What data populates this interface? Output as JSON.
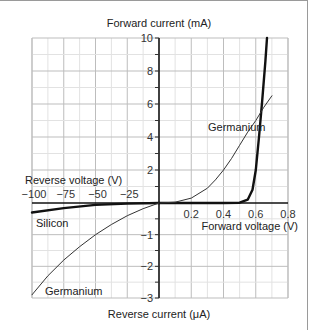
{
  "chart_data": {
    "type": "line",
    "title": "",
    "axes": {
      "y_top_label": "Forward current (mA)",
      "y_bottom_label": "Reverse current (μA)",
      "x_left_label": "Reverse voltage (V)",
      "x_right_label": "Forward voltage (V)",
      "x_left_ticks": [
        "−100",
        "−75",
        "−50",
        "−25"
      ],
      "x_left_tick_values": [
        -100,
        -75,
        -50,
        -25
      ],
      "x_right_ticks": [
        "0.2",
        "0.4",
        "0.6",
        "0.8"
      ],
      "x_right_tick_values": [
        0.2,
        0.4,
        0.6,
        0.8
      ],
      "y_top_ticks": [
        "10",
        "8",
        "6",
        "4",
        "2"
      ],
      "y_top_tick_values": [
        10,
        8,
        6,
        4,
        2
      ],
      "y_bottom_ticks": [
        "−1",
        "−2",
        "−3"
      ],
      "y_bottom_tick_values": [
        -1,
        -2,
        -3
      ],
      "x_left_range": [
        -100,
        0
      ],
      "x_right_range": [
        0,
        0.8
      ],
      "y_top_range": [
        0,
        10
      ],
      "y_bottom_range": [
        -3,
        0
      ],
      "grid": true
    },
    "series": [
      {
        "name": "Silicon (forward)",
        "label": "",
        "style": "thick",
        "x": [
          0,
          0.2,
          0.4,
          0.5,
          0.55,
          0.58,
          0.6,
          0.62,
          0.64,
          0.66,
          0.67
        ],
        "y": [
          0,
          0,
          0,
          0.02,
          0.2,
          0.8,
          2.0,
          4.0,
          6.2,
          8.6,
          10
        ]
      },
      {
        "name": "Germanium (forward)",
        "label": "Germanium",
        "style": "thin",
        "x": [
          0,
          0.1,
          0.2,
          0.3,
          0.35,
          0.4,
          0.45,
          0.5,
          0.55,
          0.6,
          0.65,
          0.7
        ],
        "y": [
          0,
          0.05,
          0.3,
          0.9,
          1.4,
          2.0,
          2.7,
          3.5,
          4.3,
          5.0,
          5.8,
          6.5
        ]
      },
      {
        "name": "Silicon (reverse)",
        "label": "Silicon",
        "style": "thick",
        "x": [
          0,
          -25,
          -50,
          -75,
          -100
        ],
        "y": [
          0,
          -0.02,
          -0.06,
          -0.16,
          -0.3
        ]
      },
      {
        "name": "Germanium (reverse)",
        "label": "Germanium",
        "style": "thin",
        "x": [
          0,
          -12.5,
          -25,
          -37.5,
          -50,
          -62.5,
          -75,
          -87.5,
          -100
        ],
        "y": [
          0,
          -0.18,
          -0.4,
          -0.68,
          -1.0,
          -1.38,
          -1.8,
          -2.3,
          -2.9
        ]
      }
    ],
    "annotations": [
      {
        "text": "Germanium",
        "near": "forward germanium curve"
      },
      {
        "text": "Silicon",
        "near": "reverse silicon curve"
      },
      {
        "text": "Germanium",
        "near": "reverse germanium curve"
      }
    ]
  }
}
